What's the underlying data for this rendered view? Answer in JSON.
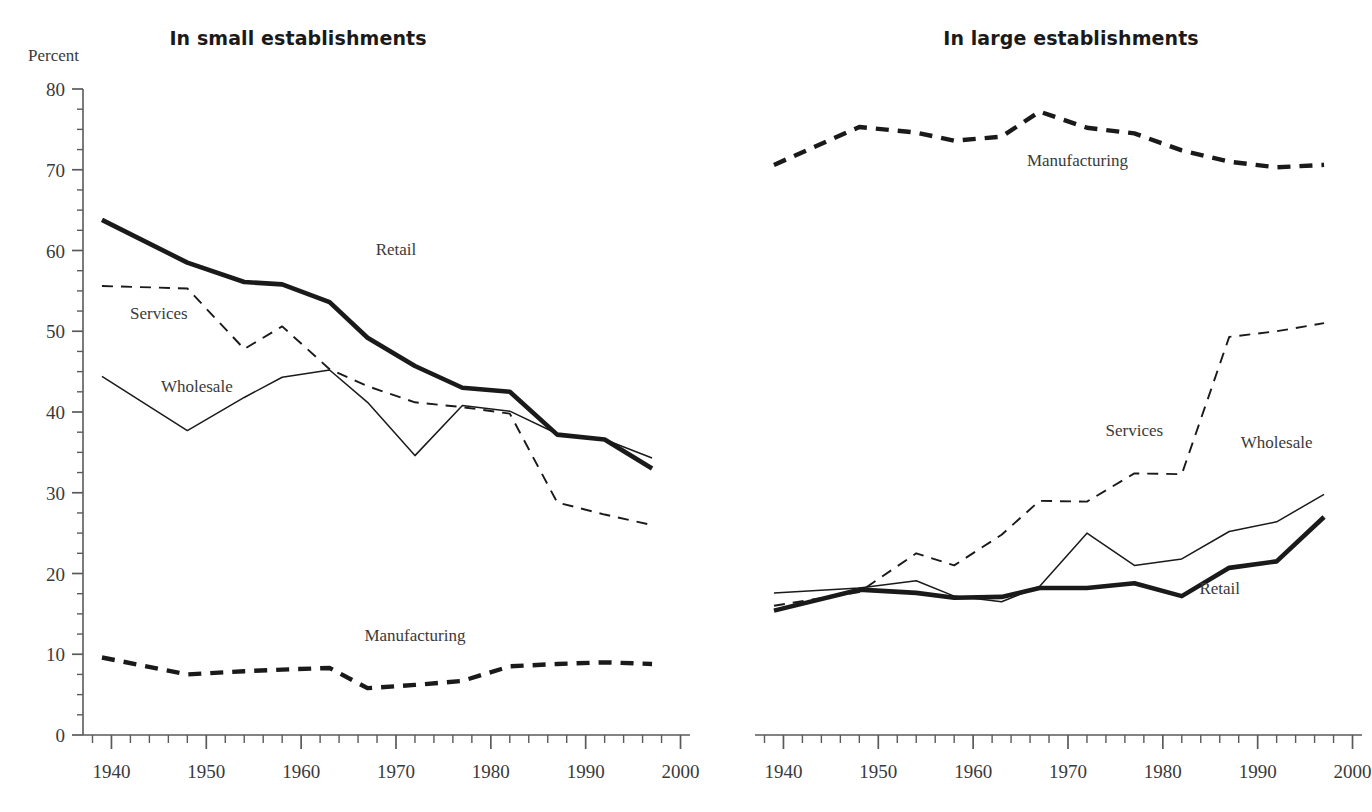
{
  "figure": {
    "axis_unit_label": "Percent",
    "ink_color": "#1a1a1a",
    "text_color": "#3a3a3a",
    "background": "#ffffff"
  },
  "panels": [
    {
      "id": "small",
      "title": "In small establishments"
    },
    {
      "id": "large",
      "title": "In large establishments"
    }
  ],
  "axes": {
    "y_ticks": [
      0,
      10,
      20,
      30,
      40,
      50,
      60,
      70,
      80
    ],
    "y_tick_labels": [
      "0",
      "10",
      "20",
      "30",
      "40",
      "50",
      "60",
      "70",
      "80"
    ],
    "y_minor_step": 2.5,
    "x_ticks": [
      1940,
      1950,
      1960,
      1970,
      1980,
      1990,
      2000
    ],
    "x_tick_labels": [
      "1940",
      "1950",
      "1960",
      "1970",
      "1980",
      "1990",
      "2000"
    ],
    "x_minor_step": 2,
    "ylim": [
      0,
      80
    ],
    "xlim": [
      1937,
      2001
    ]
  },
  "chart_data": [
    {
      "type": "line",
      "title": "In small establishments",
      "xlabel": "",
      "ylabel": "Percent",
      "xlim": [
        1937,
        2001
      ],
      "ylim": [
        0,
        80
      ],
      "grid": false,
      "legend": "inline-labels",
      "series": [
        {
          "name": "Retail",
          "style": "thick-solid",
          "label_x": 1970,
          "label_y": 59.5,
          "x": [
            1939,
            1948,
            1954,
            1958,
            1963,
            1967,
            1972,
            1977,
            1982,
            1987,
            1992,
            1997
          ],
          "values": [
            63.8,
            58.5,
            56.1,
            55.8,
            53.6,
            49.2,
            45.7,
            43.0,
            42.5,
            37.2,
            36.6,
            33.0
          ]
        },
        {
          "name": "Wholesale",
          "style": "thin-solid",
          "label_x": 1949,
          "label_y": 42.5,
          "x": [
            1939,
            1948,
            1954,
            1958,
            1963,
            1967,
            1972,
            1977,
            1982,
            1987,
            1992,
            1997
          ],
          "values": [
            44.4,
            37.7,
            41.8,
            44.3,
            45.2,
            41.2,
            34.6,
            40.8,
            40.1,
            37.3,
            36.6,
            34.3
          ]
        },
        {
          "name": "Services",
          "style": "thin-dashed",
          "label_x": 1945,
          "label_y": 51.5,
          "x": [
            1939,
            1948,
            1954,
            1958,
            1963,
            1967,
            1972,
            1977,
            1982,
            1987,
            1992,
            1997
          ],
          "values": [
            55.6,
            55.3,
            47.8,
            50.6,
            45.3,
            43.2,
            41.2,
            40.6,
            39.8,
            28.8,
            27.3,
            26.0
          ]
        },
        {
          "name": "Manufacturing",
          "style": "thick-dashed",
          "label_x": 1972,
          "label_y": 11.6,
          "x": [
            1939,
            1948,
            1954,
            1958,
            1963,
            1967,
            1972,
            1977,
            1982,
            1987,
            1992,
            1997
          ],
          "values": [
            9.6,
            7.5,
            7.9,
            8.1,
            8.3,
            5.8,
            6.2,
            6.7,
            8.5,
            8.8,
            9.0,
            8.8
          ]
        }
      ]
    },
    {
      "type": "line",
      "title": "In large establishments",
      "xlabel": "",
      "ylabel": "Percent",
      "xlim": [
        1937,
        2001
      ],
      "ylim": [
        0,
        80
      ],
      "grid": false,
      "legend": "inline-labels",
      "series": [
        {
          "name": "Manufacturing",
          "style": "thick-dashed",
          "label_x": 1971,
          "label_y": 70.5,
          "x": [
            1939,
            1948,
            1954,
            1958,
            1963,
            1967,
            1972,
            1977,
            1982,
            1987,
            1992,
            1997
          ],
          "values": [
            70.6,
            75.3,
            74.6,
            73.6,
            74.1,
            77.2,
            75.2,
            74.5,
            72.4,
            71.0,
            70.3,
            70.6
          ]
        },
        {
          "name": "Services",
          "style": "thin-dashed",
          "label_x": 1977,
          "label_y": 37.0,
          "x": [
            1939,
            1948,
            1954,
            1958,
            1963,
            1967,
            1972,
            1977,
            1982,
            1987,
            1992,
            1997
          ],
          "values": [
            16.0,
            17.7,
            22.5,
            21.0,
            24.8,
            29.0,
            28.9,
            32.4,
            32.3,
            49.3,
            50.0,
            51.0
          ]
        },
        {
          "name": "Wholesale",
          "style": "thin-solid",
          "label_x": 1992,
          "label_y": 35.5,
          "x": [
            1939,
            1948,
            1954,
            1958,
            1963,
            1967,
            1972,
            1977,
            1982,
            1987,
            1992,
            1997
          ],
          "values": [
            17.6,
            18.2,
            19.1,
            17.2,
            16.5,
            18.4,
            25.0,
            21.0,
            21.8,
            25.2,
            26.4,
            29.8
          ]
        },
        {
          "name": "Retail",
          "style": "thick-solid",
          "label_x": 1986,
          "label_y": 17.5,
          "x": [
            1939,
            1948,
            1954,
            1958,
            1963,
            1967,
            1972,
            1977,
            1982,
            1987,
            1992,
            1997
          ],
          "values": [
            15.4,
            18.0,
            17.6,
            17.0,
            17.1,
            18.2,
            18.2,
            18.8,
            17.2,
            20.7,
            21.5,
            27.0
          ]
        }
      ]
    }
  ]
}
